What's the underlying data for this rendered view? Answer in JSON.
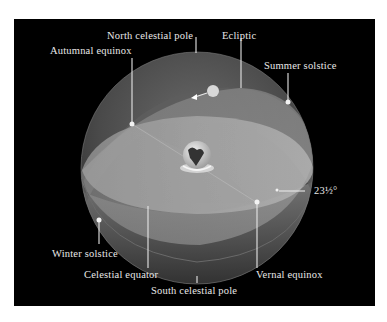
{
  "figure": {
    "background_color": "#000000",
    "sphere_color": "#8a8a8a",
    "tilt_angle_label": "23½°"
  },
  "labels": {
    "north_celestial_pole": "North celestial pole",
    "ecliptic": "Ecliptic",
    "autumnal_equinox": "Autumnal equinox",
    "summer_solstice": "Summer solstice",
    "tilt_angle": "23½°",
    "winter_solstice": "Winter solstice",
    "celestial_equator": "Celestial equator",
    "vernal_equinox": "Vernal equinox",
    "south_celestial_pole": "South celestial pole"
  },
  "objects": {
    "sun": "sun-icon",
    "earth": "earth-icon",
    "motion_arrow": "arrow-left-icon"
  }
}
